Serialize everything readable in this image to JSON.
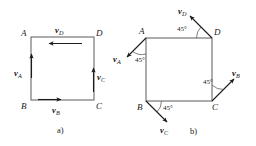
{
  "figure": {
    "panels": [
      {
        "id": "a",
        "caption": "a)",
        "vertices": [
          {
            "name": "A",
            "label": "A",
            "position": "top-left"
          },
          {
            "name": "B",
            "label": "B",
            "position": "bottom-left"
          },
          {
            "name": "C",
            "label": "C",
            "position": "bottom-right"
          },
          {
            "name": "D",
            "label": "D",
            "position": "top-right"
          }
        ],
        "vectors": [
          {
            "name": "vD",
            "symbol": "v",
            "subscript": "D",
            "direction": "left",
            "angle_deg": 180,
            "along": "top-edge"
          },
          {
            "name": "vA",
            "symbol": "v",
            "subscript": "A",
            "direction": "up",
            "angle_deg": 90,
            "along": "left-edge"
          },
          {
            "name": "vB",
            "symbol": "v",
            "subscript": "B",
            "direction": "right",
            "angle_deg": 0,
            "along": "bottom-edge"
          },
          {
            "name": "vC",
            "symbol": "v",
            "subscript": "C",
            "direction": "up",
            "angle_deg": 90,
            "along": "right-edge"
          }
        ],
        "angles": []
      },
      {
        "id": "b",
        "caption": "b)",
        "vertices": [
          {
            "name": "A",
            "label": "A",
            "position": "top-left"
          },
          {
            "name": "B",
            "label": "B",
            "position": "bottom-left"
          },
          {
            "name": "C",
            "label": "C",
            "position": "bottom-right"
          },
          {
            "name": "D",
            "label": "D",
            "position": "top-right"
          }
        ],
        "vectors": [
          {
            "name": "vD",
            "symbol": "v",
            "subscript": "D",
            "direction": "up-left",
            "angle_deg": 135,
            "from_vertex": "D"
          },
          {
            "name": "vA",
            "symbol": "v",
            "subscript": "A",
            "direction": "down-left",
            "angle_deg": 225,
            "from_vertex": "A"
          },
          {
            "name": "vB",
            "symbol": "v",
            "subscript": "B",
            "direction": "down-right",
            "angle_deg": 315,
            "from_vertex": "B"
          },
          {
            "name": "vC",
            "symbol": "v",
            "subscript": "C",
            "direction": "up-right",
            "angle_deg": 45,
            "from_vertex": "C"
          }
        ],
        "angles": [
          {
            "name": "angle-at-D",
            "value": "45",
            "unit": "°",
            "text": "45°",
            "vertex": "D"
          },
          {
            "name": "angle-at-A",
            "value": "45",
            "unit": "°",
            "text": "45°",
            "vertex": "A"
          },
          {
            "name": "angle-at-C",
            "value": "45",
            "unit": "°",
            "text": "45°",
            "vertex": "C"
          },
          {
            "name": "angle-at-B",
            "value": "45",
            "unit": "°",
            "text": "45°",
            "vertex": "B"
          }
        ]
      }
    ]
  },
  "colors": {
    "background": "#ffffff",
    "edge": "#5a5a5a",
    "vector": "#1c1c1c",
    "text": "#1a1a1a",
    "arc": "#4a4a4a"
  },
  "symbols": {
    "v": "v",
    "degree": "°"
  }
}
